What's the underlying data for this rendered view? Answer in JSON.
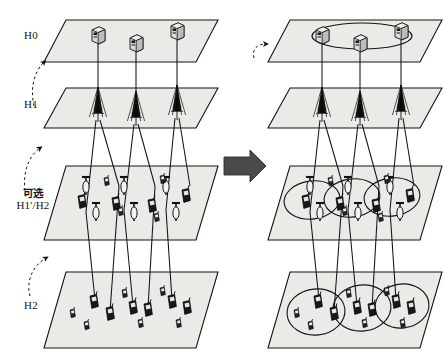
{
  "figure": {
    "type": "layered-network-topology-diagram",
    "panels": [
      {
        "id": "before",
        "name": "left-panel",
        "note": "tree topology, no rings"
      },
      {
        "id": "after",
        "name": "right-panel",
        "note": "ring topology added at each layer"
      }
    ]
  },
  "labels": {
    "h0": "H0",
    "h1": "H1",
    "optional_line1": "可选",
    "optional_line2": "H1'/H2",
    "h2": "H2"
  },
  "transition": {
    "arrow_name": "transition-arrow",
    "direction": "right"
  },
  "colors": {
    "plane_fill": "#ebeae6",
    "plane_stroke": "#1a1a1a",
    "link_stroke": "#1a1a1a",
    "node_fill": "#d9d8d4",
    "node_dark": "#1a1a1a",
    "arrow_fill": "#4a4a4a",
    "background": "#ffffff"
  },
  "layers": [
    {
      "id": "h0",
      "label": "H0",
      "node_type": "server-cabinet",
      "node_count_left": 3,
      "node_count_right": 3,
      "ring_left": false,
      "ring_right": true
    },
    {
      "id": "h1",
      "label": "H1",
      "node_type": "antenna-tower",
      "node_count_left": 3,
      "node_count_right": 3,
      "ring_left": false,
      "ring_right": false
    },
    {
      "id": "h1p_h2",
      "label": "可选 H1'/H2",
      "node_type": "small-antenna-and-handset",
      "node_count_left": 14,
      "node_count_right": 14,
      "ring_left": false,
      "ring_right": true,
      "ring_count_right": 3
    },
    {
      "id": "h2",
      "label": "H2",
      "node_type": "handset",
      "node_count_left": 12,
      "node_count_right": 12,
      "ring_left": false,
      "ring_right": true,
      "ring_count_right": 3
    }
  ]
}
